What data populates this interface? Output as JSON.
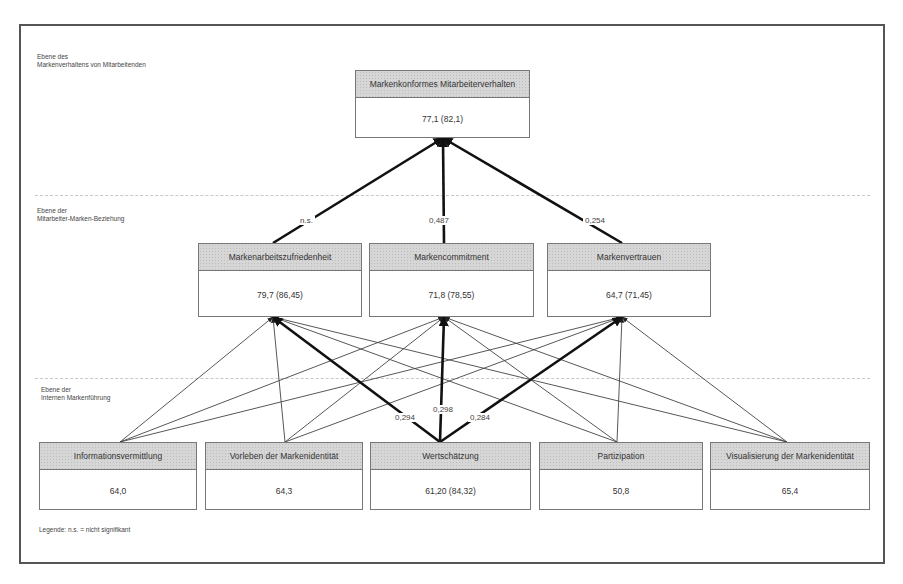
{
  "levels": {
    "behavior": [
      "Ebene des",
      "Markenverhaltens von Mitarbeitenden"
    ],
    "relationship": [
      "Ebene der",
      "Mitarbeiter-Marken-Beziehung"
    ],
    "internal": [
      "Ebene der",
      "Internen Markenführung"
    ]
  },
  "nodes": {
    "top": {
      "title": "Markenkonformes Mitarbeiterverhalten",
      "value": "77,1 (82,1)"
    },
    "mid": [
      {
        "title": "Markenarbeitszufriedenheit",
        "value": "79,7 (86,45)"
      },
      {
        "title": "Markencommitment",
        "value": "71,8 (78,55)"
      },
      {
        "title": "Markenvertrauen",
        "value": "64,7 (71,45)"
      }
    ],
    "bottom": [
      {
        "title": "Informationsvermittlung",
        "value": "64,0"
      },
      {
        "title": "Vorleben der Markenidentität",
        "value": "64,3"
      },
      {
        "title": "Wertschätzung",
        "value": "61,20 (84,32)"
      },
      {
        "title": "Partizipation",
        "value": "50,8"
      },
      {
        "title": "Visualisierung der Markenidentität",
        "value": "65,4"
      }
    ]
  },
  "coefficients": {
    "mid_to_top": [
      "n.s.",
      "0,487",
      "0,254"
    ],
    "wertschaetzung_to_mid": [
      "0,294",
      "0,298",
      "0,284"
    ]
  },
  "legend": "Legende: n.s. = nicht signifikant"
}
